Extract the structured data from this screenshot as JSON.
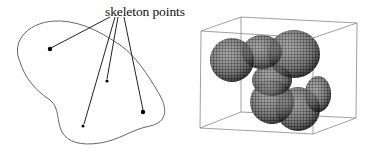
{
  "figure": {
    "left_panel": {
      "label": "skeleton points",
      "outline_path": "M 20 62 C 10 40, 30 20, 60 21 C 85 22, 105 35, 120 45 C 135 55, 148 75, 158 92 C 168 108, 168 122, 150 126 C 130 130, 120 140, 100 143 C 80 146, 68 142, 62 132 C 56 120, 60 108, 50 100 C 35 90, 25 78, 20 62 Z",
      "skeleton_points": [
        {
          "x": 50,
          "y": 49,
          "r": 2.2
        },
        {
          "x": 107,
          "y": 81,
          "r": 1.5
        },
        {
          "x": 83,
          "y": 126,
          "r": 1.5
        },
        {
          "x": 143,
          "y": 112,
          "r": 2.2
        }
      ],
      "leader_lines": [
        {
          "x1": 110,
          "y1": 17,
          "x2": 51,
          "y2": 48
        },
        {
          "x1": 115,
          "y1": 17,
          "x2": 84,
          "y2": 124
        },
        {
          "x1": 118,
          "y1": 17,
          "x2": 107,
          "y2": 79
        },
        {
          "x1": 124,
          "y1": 17,
          "x2": 143,
          "y2": 110
        }
      ]
    },
    "right_panel": {
      "box": {
        "front_top_left": [
          201,
          31
        ],
        "front_bottom_left": [
          200,
          128
        ],
        "front_top_right": [
          313,
          38
        ],
        "front_bottom_right": [
          313,
          134
        ],
        "back_top_left": [
          241,
          17
        ],
        "back_bottom_left": [
          241,
          112
        ],
        "back_top_right": [
          357,
          23
        ],
        "back_bottom_right": [
          356,
          118
        ]
      },
      "blob_lobes": [
        {
          "cx": 232,
          "cy": 60,
          "rx": 22,
          "ry": 22
        },
        {
          "cx": 262,
          "cy": 52,
          "rx": 20,
          "ry": 17
        },
        {
          "cx": 294,
          "cy": 54,
          "rx": 26,
          "ry": 24
        },
        {
          "cx": 272,
          "cy": 80,
          "rx": 20,
          "ry": 16
        },
        {
          "cx": 272,
          "cy": 102,
          "rx": 22,
          "ry": 22
        },
        {
          "cx": 298,
          "cy": 109,
          "rx": 22,
          "ry": 22
        },
        {
          "cx": 318,
          "cy": 94,
          "rx": 13,
          "ry": 18
        }
      ],
      "colors": {
        "mesh": "#1a1a1a",
        "fill": "#6e6e6e",
        "box_line": "#888888"
      }
    },
    "colors": {
      "ink": "#222222",
      "outline": "#555555"
    }
  }
}
